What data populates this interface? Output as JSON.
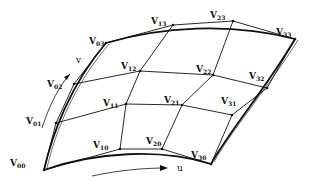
{
  "diagram": {
    "axes": {
      "u_label": "u",
      "v_label": "v"
    },
    "vertices": [
      {
        "id": "V00",
        "base": "V",
        "sub": "00",
        "x": 44,
        "y": 170,
        "lx": 10,
        "ly": 166
      },
      {
        "id": "V10",
        "base": "V",
        "sub": "10",
        "x": 120,
        "y": 149,
        "lx": 93,
        "ly": 148
      },
      {
        "id": "V20",
        "base": "V",
        "sub": "20",
        "x": 162,
        "y": 149,
        "lx": 146,
        "ly": 144
      },
      {
        "id": "V30",
        "base": "V",
        "sub": "30",
        "x": 211,
        "y": 164,
        "lx": 191,
        "ly": 158
      },
      {
        "id": "V01",
        "base": "V",
        "sub": "01",
        "x": 56,
        "y": 123,
        "lx": 26,
        "ly": 124
      },
      {
        "id": "V11",
        "base": "V",
        "sub": "11",
        "x": 126,
        "y": 104,
        "lx": 103,
        "ly": 106
      },
      {
        "id": "V21",
        "base": "V",
        "sub": "21",
        "x": 182,
        "y": 105,
        "lx": 164,
        "ly": 103
      },
      {
        "id": "V31",
        "base": "V",
        "sub": "31",
        "x": 232,
        "y": 115,
        "lx": 221,
        "ly": 104
      },
      {
        "id": "V02",
        "base": "V",
        "sub": "02",
        "x": 74,
        "y": 84,
        "lx": 47,
        "ly": 87
      },
      {
        "id": "V12",
        "base": "V",
        "sub": "12",
        "x": 140,
        "y": 71,
        "lx": 121,
        "ly": 69
      },
      {
        "id": "V22",
        "base": "V",
        "sub": "22",
        "x": 213,
        "y": 75,
        "lx": 196,
        "ly": 72
      },
      {
        "id": "V32",
        "base": "V",
        "sub": "32",
        "x": 267,
        "y": 88,
        "lx": 249,
        "ly": 79
      },
      {
        "id": "V03",
        "base": "V",
        "sub": "03",
        "x": 106,
        "y": 43,
        "lx": 89,
        "ly": 44
      },
      {
        "id": "V13",
        "base": "V",
        "sub": "13",
        "x": 173,
        "y": 25,
        "lx": 151,
        "ly": 24
      },
      {
        "id": "V23",
        "base": "V",
        "sub": "23",
        "x": 233,
        "y": 21,
        "lx": 210,
        "ly": 18
      },
      {
        "id": "V33",
        "base": "V",
        "sub": "33",
        "x": 295,
        "y": 39,
        "lx": 276,
        "ly": 35
      }
    ]
  }
}
